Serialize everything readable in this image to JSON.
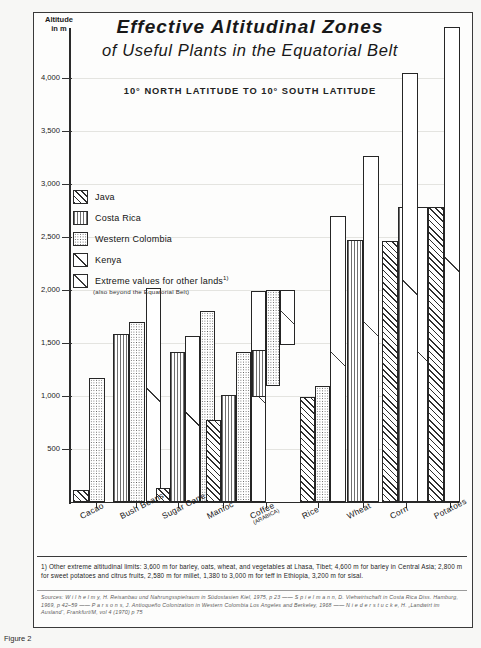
{
  "figure": {
    "title_line1": "Effective Altitudinal Zones",
    "title_line2": "of Useful Plants in the Equatorial Belt",
    "subtitle": "10° NORTH LATITUDE  TO  10° SOUTH LATITUDE",
    "caption": "Figure 2"
  },
  "legend": {
    "items": [
      {
        "label": "Java",
        "pattern": "diagonal-hatch",
        "color": "#2e2e2e"
      },
      {
        "label": "Costa Rica",
        "pattern": "vertical-lines",
        "color": "#6f6f6f"
      },
      {
        "label": "Western Colombia",
        "pattern": "dotted-stipple",
        "color": "#555555"
      },
      {
        "label": "Kenya",
        "pattern": "single-diagonal",
        "color": "#2e2e2e"
      },
      {
        "label": "Extreme values for other lands",
        "superscript": "1)",
        "pattern": "open-diagonal",
        "color": "#3a3a3a"
      }
    ],
    "sub_note": "(also beyond the Equatorial Belt)"
  },
  "notes": {
    "footnote": "1) Other extreme altitudinal limits: 3,600 m for barley, oats, wheat, and vegetables at Lhasa, Tibet; 4,600 m for barley in Central Asia; 2,800 m for sweet potatoes and citrus fruits, 2,580 m for millet, 1,380 to 3,000 m for teff in Ethiopia, 3,200 m for sisal.",
    "sources": "Sources: W i l h e l m y, H.  Reisanbau und Nahrungsspielraum in Südostasien  Kiel, 1975, p 23 ——  S p i e l m a n n, D.  Viehwirtschaft in Costa Rica  Diss. Hamburg, 1969, p 42–59 ——  P a r s o n s, J.  Antioqueño Colonization in Western Colombia  Los Angeles and Berkeley, 1968 ——  N i e d e r s t u c k e, H. „Landwirt im Ausland“, Frankfurt/M, vol 4 (1970) p 75"
  },
  "chart_data": {
    "type": "bar",
    "title": "Effective Altitudinal Zones of Useful Plants in the Equatorial Belt",
    "subtitle": "10° NORTH LATITUDE TO 10° SOUTH LATITUDE",
    "xlabel": "",
    "ylabel": "Altitude in m",
    "ylim": [
      0,
      4500
    ],
    "ytick_values": [
      500,
      1000,
      1500,
      2000,
      2500,
      3000,
      3500,
      4000
    ],
    "ytick_labels": [
      "500",
      "1,000",
      "1,500",
      "2,000",
      "2,500",
      "3,000",
      "3,500",
      "4,000"
    ],
    "grid": true,
    "legend_position": "upper-left-inside",
    "note": "Bars give the upper altitudinal limit measured from sea level; Coffee (Arabica) bars are floating range bars (lower limit to upper limit).",
    "categories": [
      "Cacao",
      "Bush Beans",
      "Sugar Cane",
      "Manioc",
      "Coffee (ARABICA)",
      "Rice",
      "Wheat",
      "Corn",
      "Potatoes"
    ],
    "series": [
      {
        "name": "Java",
        "values": [
          200,
          null,
          230,
          900,
          null,
          1000,
          null,
          2460,
          2780
        ]
      },
      {
        "name": "Costa Rica",
        "values": [
          null,
          1580,
          1420,
          1180,
          1300,
          1100,
          2470,
          2780,
          2780
        ]
      },
      {
        "name": "Western Colombia",
        "values": [
          1180,
          1700,
          1810,
          1420,
          2000,
          1200,
          null,
          null,
          1580
        ]
      },
      {
        "name": "Kenya",
        "values": [
          null,
          null,
          1570,
          null,
          null,
          null,
          null,
          2780,
          1800
        ]
      },
      {
        "name": "Extreme values for other lands",
        "values": [
          null,
          2020,
          2000,
          2070,
          2700,
          2700,
          3270,
          3860,
          4400
        ]
      }
    ],
    "range_bars": {
      "category": "Coffee (ARABICA)",
      "bars": [
        {
          "series": "Costa Rica",
          "low": 1000,
          "high": 1420
        },
        {
          "series": "Western Colombia",
          "low": 1100,
          "high": 2000
        },
        {
          "series": "Extreme values for other lands",
          "low": 1470,
          "high": 2000
        }
      ]
    },
    "bars_px": [
      {
        "cat": "Cacao",
        "series": "Java",
        "x": 73,
        "w": 16,
        "top": 490,
        "bottom": 502
      },
      {
        "cat": "Cacao",
        "series": "Western Colombia",
        "x": 89,
        "w": 16,
        "top": 378,
        "bottom": 502
      },
      {
        "cat": "Bush Beans",
        "series": "Costa Rica",
        "x": 113,
        "w": 16,
        "top": 334,
        "bottom": 502
      },
      {
        "cat": "Bush Beans",
        "series": "Western Colombia",
        "x": 129,
        "w": 16,
        "top": 322,
        "bottom": 502
      },
      {
        "cat": "Bush Beans",
        "series": "Extreme",
        "x": 146,
        "w": 15,
        "top": 288,
        "bottom": 502
      },
      {
        "cat": "Sugar Cane",
        "series": "Java",
        "x": 156,
        "w": 14,
        "top": 488,
        "bottom": 502
      },
      {
        "cat": "Sugar Cane",
        "series": "Costa Rica",
        "x": 170,
        "w": 15,
        "top": 352,
        "bottom": 502
      },
      {
        "cat": "Sugar Cane",
        "series": "Kenya",
        "x": 185,
        "w": 15,
        "top": 336,
        "bottom": 502
      },
      {
        "cat": "Sugar Cane",
        "series": "Western Colombia",
        "x": 200,
        "w": 15,
        "top": 311,
        "bottom": 502
      },
      {
        "cat": "Manioc",
        "series": "Java",
        "x": 206,
        "w": 15,
        "top": 420,
        "bottom": 502
      },
      {
        "cat": "Manioc",
        "series": "Costa Rica",
        "x": 221,
        "w": 15,
        "top": 395,
        "bottom": 502
      },
      {
        "cat": "Manioc",
        "series": "Western Colombia",
        "x": 236,
        "w": 15,
        "top": 352,
        "bottom": 502
      },
      {
        "cat": "Manioc",
        "series": "Extreme",
        "x": 251,
        "w": 15,
        "top": 291,
        "bottom": 502
      },
      {
        "cat": "Coffee",
        "series": "Costa Rica",
        "x": 252,
        "w": 14,
        "top": 350,
        "bottom": 397
      },
      {
        "cat": "Coffee",
        "series": "Western Colombia",
        "x": 266,
        "w": 14,
        "top": 290,
        "bottom": 386
      },
      {
        "cat": "Coffee",
        "series": "Extreme",
        "x": 280,
        "w": 15,
        "top": 290,
        "bottom": 345
      },
      {
        "cat": "Rice",
        "series": "Java",
        "x": 300,
        "w": 15,
        "top": 397,
        "bottom": 502
      },
      {
        "cat": "Rice",
        "series": "Western Colombia",
        "x": 315,
        "w": 15,
        "top": 386,
        "bottom": 502
      },
      {
        "cat": "Rice",
        "series": "Extreme",
        "x": 330,
        "w": 16,
        "top": 216,
        "bottom": 502
      },
      {
        "cat": "Wheat",
        "series": "Costa Rica",
        "x": 347,
        "w": 16,
        "top": 240,
        "bottom": 502
      },
      {
        "cat": "Wheat",
        "series": "Extreme",
        "x": 363,
        "w": 16,
        "top": 156,
        "bottom": 502
      },
      {
        "cat": "Corn",
        "series": "Java",
        "x": 382,
        "w": 16,
        "top": 241,
        "bottom": 502
      },
      {
        "cat": "Corn",
        "series": "Costa Rica",
        "x": 398,
        "w": 15,
        "top": 207,
        "bottom": 502
      },
      {
        "cat": "Corn",
        "series": "Kenya",
        "x": 413,
        "w": 15,
        "top": 207,
        "bottom": 502
      },
      {
        "cat": "Corn",
        "series": "Extreme",
        "x": 402,
        "w": 16,
        "top": 73,
        "bottom": 502
      },
      {
        "cat": "Potatoes",
        "series": "Western Colombia",
        "x": 428,
        "w": 15,
        "top": 334,
        "bottom": 502
      },
      {
        "cat": "Potatoes",
        "series": "Kenya",
        "x": 428,
        "w": 15,
        "top": 311,
        "bottom": 502
      },
      {
        "cat": "Potatoes",
        "series": "Java",
        "x": 428,
        "w": 16,
        "top": 207,
        "bottom": 502
      },
      {
        "cat": "Potatoes",
        "series": "Extreme",
        "x": 444,
        "w": 16,
        "top": 27,
        "bottom": 502
      }
    ]
  },
  "axis": {
    "y_title_line1": "Altitude",
    "y_title_line2": "in m"
  },
  "xaxis": {
    "labels": [
      {
        "text": "Cacao",
        "sub": ""
      },
      {
        "text": "Bush Beans",
        "sub": ""
      },
      {
        "text": "Sugar Cane",
        "sub": ""
      },
      {
        "text": "Manioc",
        "sub": ""
      },
      {
        "text": "Coffee",
        "sub": "(ARABICA)"
      },
      {
        "text": "Rice",
        "sub": ""
      },
      {
        "text": "Wheat",
        "sub": ""
      },
      {
        "text": "Corn",
        "sub": ""
      },
      {
        "text": "Potatoes",
        "sub": ""
      }
    ]
  }
}
